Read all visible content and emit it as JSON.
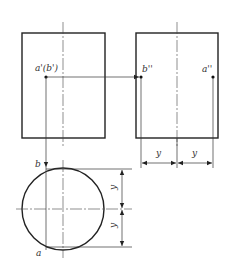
{
  "figure": {
    "type": "orthographic-projection",
    "views": {
      "front": {
        "label_point": "a'(b')"
      },
      "side": {
        "label_left": "b''",
        "label_right": "a''"
      },
      "top": {
        "label_top": "b",
        "label_bottom": "a"
      }
    },
    "dimensions": {
      "horizontal_left": "y",
      "horizontal_right": "y",
      "vertical_top": "y",
      "vertical_bottom": "y"
    },
    "colors": {
      "line": "#222222",
      "background": "#ffffff"
    }
  }
}
